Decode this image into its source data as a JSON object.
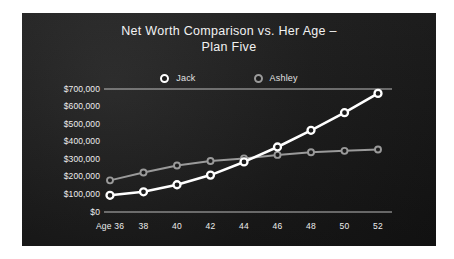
{
  "chart_data": {
    "type": "line",
    "title": "Net Worth Comparison vs.  Her Age – Plan Five",
    "title_line1": "Net Worth Comparison vs.  Her Age –",
    "title_line2": "Plan Five",
    "xlabel": "",
    "ylabel": "",
    "categories": [
      "Age 36",
      "38",
      "40",
      "42",
      "44",
      "46",
      "48",
      "50",
      "52"
    ],
    "x": [
      36,
      38,
      40,
      42,
      44,
      46,
      48,
      50,
      52
    ],
    "ylim": [
      0,
      700000
    ],
    "ytick_labels": [
      "$700,000",
      "$600,000",
      "$500,000",
      "$400,000",
      "$300,000",
      "$200,000",
      "$100,000",
      "$0"
    ],
    "ytick_values": [
      700000,
      600000,
      500000,
      400000,
      300000,
      200000,
      100000,
      0
    ],
    "grid": "top-line-only",
    "legend_position": "top-center",
    "series": [
      {
        "name": "Jack",
        "color": "#ffffff",
        "marker": "circle-open",
        "values": [
          95000,
          115000,
          155000,
          210000,
          285000,
          370000,
          465000,
          565000,
          675000
        ]
      },
      {
        "name": "Ashley",
        "color": "#9a9a9a",
        "marker": "circle-open",
        "values": [
          180000,
          225000,
          265000,
          290000,
          305000,
          325000,
          340000,
          348000,
          356000
        ]
      }
    ]
  },
  "panel": {
    "background": "#1b1b1b",
    "axis_color": "#d8d8d8"
  }
}
